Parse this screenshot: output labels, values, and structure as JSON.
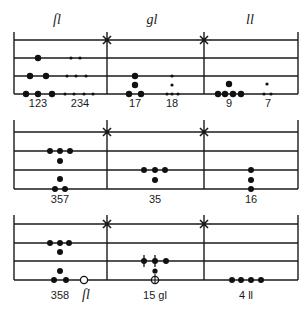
{
  "headers": [
    {
      "text": "ſl",
      "x": 57
    },
    {
      "text": "gl",
      "x": 152
    },
    {
      "text": "ll",
      "x": 250
    }
  ],
  "layout": {
    "left_x": 14,
    "right_x": 298,
    "star_bars_x": [
      107,
      204
    ],
    "staves": [
      {
        "bar_top": 32,
        "lines_y": [
          40,
          58,
          76,
          94
        ]
      },
      {
        "bar_top": 120,
        "lines_y": [
          132,
          151,
          170,
          189
        ]
      },
      {
        "bar_top": 215,
        "lines_y": [
          224,
          243,
          261,
          280
        ]
      }
    ]
  },
  "staves": [
    {
      "name": "staff-1",
      "labels": [
        {
          "text": "123",
          "x": 38,
          "y": 107
        },
        {
          "text": "234",
          "x": 80,
          "y": 107
        },
        {
          "text": "17",
          "x": 135,
          "y": 107
        },
        {
          "text": "18",
          "x": 172,
          "y": 107
        },
        {
          "text": "9",
          "x": 229,
          "y": 107
        },
        {
          "text": "7",
          "x": 268,
          "y": 107
        }
      ],
      "dots": [
        {
          "x": 38,
          "y": 58,
          "r": 3.2
        },
        {
          "x": 71,
          "y": 58,
          "r": 1.6
        },
        {
          "x": 80,
          "y": 58,
          "r": 1.6
        },
        {
          "x": 30,
          "y": 76,
          "r": 3.2
        },
        {
          "x": 46,
          "y": 76,
          "r": 3.2
        },
        {
          "x": 67,
          "y": 76,
          "r": 1.6
        },
        {
          "x": 76,
          "y": 76,
          "r": 1.6
        },
        {
          "x": 86,
          "y": 76,
          "r": 1.6
        },
        {
          "x": 26,
          "y": 94,
          "r": 3.2
        },
        {
          "x": 38,
          "y": 94,
          "r": 3.2
        },
        {
          "x": 52,
          "y": 94,
          "r": 3.2
        },
        {
          "x": 65,
          "y": 94,
          "r": 1.6
        },
        {
          "x": 74,
          "y": 94,
          "r": 1.6
        },
        {
          "x": 84,
          "y": 94,
          "r": 1.6
        },
        {
          "x": 93,
          "y": 94,
          "r": 1.6
        },
        {
          "x": 135,
          "y": 76,
          "r": 3.2
        },
        {
          "x": 135,
          "y": 85,
          "r": 3.2
        },
        {
          "x": 129,
          "y": 94,
          "r": 3.2
        },
        {
          "x": 141,
          "y": 94,
          "r": 3.2
        },
        {
          "x": 172,
          "y": 76,
          "r": 1.6
        },
        {
          "x": 172,
          "y": 85,
          "r": 1.6
        },
        {
          "x": 167,
          "y": 94,
          "r": 1.6
        },
        {
          "x": 172,
          "y": 94,
          "r": 1.6
        },
        {
          "x": 178,
          "y": 94,
          "r": 1.6
        },
        {
          "x": 229,
          "y": 84,
          "r": 3.2
        },
        {
          "x": 218,
          "y": 94,
          "r": 3.2
        },
        {
          "x": 225,
          "y": 94,
          "r": 3.2
        },
        {
          "x": 233,
          "y": 94,
          "r": 3.2
        },
        {
          "x": 241,
          "y": 94,
          "r": 3.2
        },
        {
          "x": 267,
          "y": 84,
          "r": 1.6
        },
        {
          "x": 264,
          "y": 94,
          "r": 1.6
        },
        {
          "x": 271,
          "y": 94,
          "r": 1.6
        }
      ]
    },
    {
      "name": "staff-2",
      "labels": [
        {
          "text": "357",
          "x": 60,
          "y": 203
        },
        {
          "text": "35",
          "x": 155,
          "y": 203
        },
        {
          "text": "16",
          "x": 251,
          "y": 203
        }
      ],
      "dots": [
        {
          "x": 50,
          "y": 151,
          "r": 3
        },
        {
          "x": 60,
          "y": 151,
          "r": 3
        },
        {
          "x": 70,
          "y": 151,
          "r": 3
        },
        {
          "x": 60,
          "y": 161,
          "r": 3
        },
        {
          "x": 60,
          "y": 179,
          "r": 3
        },
        {
          "x": 55,
          "y": 189,
          "r": 3
        },
        {
          "x": 65,
          "y": 189,
          "r": 3
        },
        {
          "x": 144,
          "y": 170,
          "r": 3
        },
        {
          "x": 155,
          "y": 170,
          "r": 3
        },
        {
          "x": 165,
          "y": 170,
          "r": 3
        },
        {
          "x": 155,
          "y": 180,
          "r": 3
        },
        {
          "x": 251,
          "y": 170,
          "r": 3
        },
        {
          "x": 251,
          "y": 180,
          "r": 3
        },
        {
          "x": 251,
          "y": 189,
          "r": 3
        }
      ]
    },
    {
      "name": "staff-3",
      "labels": [
        {
          "text": "358",
          "x": 60,
          "y": 299
        },
        {
          "text": "ſl",
          "x": 86,
          "y": 299,
          "italic": true
        },
        {
          "text": "15 gl",
          "x": 155,
          "y": 299
        },
        {
          "text": "4 ll",
          "x": 246,
          "y": 299
        }
      ],
      "dots": [
        {
          "x": 50,
          "y": 243,
          "r": 3
        },
        {
          "x": 60,
          "y": 243,
          "r": 3
        },
        {
          "x": 69,
          "y": 243,
          "r": 3
        },
        {
          "x": 60,
          "y": 252,
          "r": 3
        },
        {
          "x": 60,
          "y": 271,
          "r": 3
        },
        {
          "x": 54,
          "y": 280,
          "r": 3
        },
        {
          "x": 66,
          "y": 280,
          "r": 3
        },
        {
          "x": 166,
          "y": 261,
          "r": 3
        },
        {
          "x": 155,
          "y": 271,
          "r": 2.6
        },
        {
          "x": 232,
          "y": 280,
          "r": 3
        },
        {
          "x": 241,
          "y": 280,
          "r": 3
        },
        {
          "x": 251,
          "y": 280,
          "r": 3
        },
        {
          "x": 261,
          "y": 280,
          "r": 3
        }
      ],
      "crossed_dots": [
        {
          "x": 144,
          "y": 261
        },
        {
          "x": 155,
          "y": 261
        }
      ],
      "open_circles": [
        {
          "x": 84,
          "y": 280,
          "plus": false
        },
        {
          "x": 155,
          "y": 280,
          "plus": true
        }
      ]
    }
  ]
}
